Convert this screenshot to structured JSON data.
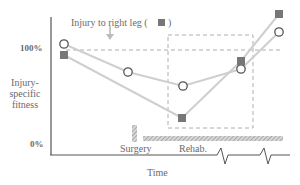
{
  "diagram": {
    "annotation": "Injury to right leg (",
    "annotation_close": ")",
    "y_axis": {
      "label_lines": [
        "Injury-",
        "specific",
        "fitness"
      ],
      "tick_100": "100%",
      "tick_0": "0%"
    },
    "x_axis": {
      "label": "Time"
    },
    "phases": {
      "surgery": "Surgery",
      "rehab": "Rehab."
    },
    "series": [
      {
        "name": "left leg (open circle)",
        "marker": "circle",
        "points": [
          [
            64,
            44
          ],
          [
            128,
            72
          ],
          [
            183,
            86
          ],
          [
            241,
            69
          ],
          [
            279,
            32
          ]
        ]
      },
      {
        "name": "right leg (filled square)",
        "marker": "square",
        "points": [
          [
            64,
            55
          ],
          [
            182,
            118
          ],
          [
            241,
            61
          ],
          [
            279,
            14
          ]
        ]
      }
    ],
    "colors": {
      "axis": "#555555",
      "line": "#cfcfcf",
      "marker_fill": "#777777",
      "dash": "#999999",
      "text": "#6a6a6a"
    }
  }
}
